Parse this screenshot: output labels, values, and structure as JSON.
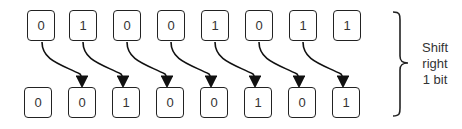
{
  "diagram": {
    "top_row": [
      "0",
      "1",
      "0",
      "0",
      "1",
      "0",
      "1",
      "1"
    ],
    "bottom_row": [
      "0",
      "0",
      "1",
      "0",
      "0",
      "1",
      "0",
      "1"
    ],
    "label_lines": [
      "Shift",
      "right",
      "1 bit"
    ],
    "stroke_color": "#222222",
    "text_color": "#333333"
  }
}
